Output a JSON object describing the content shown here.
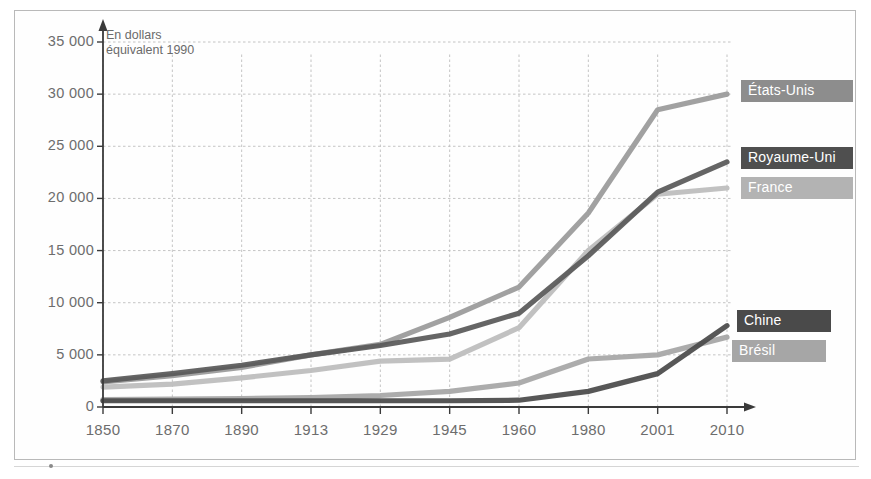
{
  "chart_data": {
    "type": "line",
    "title": "",
    "subtitle": "",
    "unit_note": "En dollars\néquivalent 1990",
    "xlabel": "",
    "ylabel": "",
    "categories": [
      "1850",
      "1870",
      "1890",
      "1913",
      "1929",
      "1945",
      "1960",
      "1980",
      "2001",
      "2010"
    ],
    "ylim": [
      0,
      35000
    ],
    "yticks": [
      0,
      5000,
      10000,
      15000,
      20000,
      25000,
      30000,
      35000
    ],
    "ytick_labels": [
      "0",
      "5 000",
      "10 000",
      "15 000",
      "20 000",
      "25 000",
      "30 000",
      "35 000"
    ],
    "grid": true,
    "legend_position": "right-inline",
    "series": [
      {
        "name": "États-Unis",
        "color": "#9a9a9a",
        "values": [
          2400,
          3000,
          3800,
          5000,
          6000,
          8600,
          11500,
          18600,
          28500,
          30000
        ]
      },
      {
        "name": "Royaume-Uni",
        "color": "#595959",
        "values": [
          2500,
          3200,
          4000,
          5000,
          5900,
          7000,
          9000,
          14500,
          20600,
          23500
        ]
      },
      {
        "name": "France",
        "color": "#bcbcbc",
        "values": [
          1900,
          2200,
          2800,
          3500,
          4400,
          4600,
          7600,
          15000,
          20400,
          21000
        ]
      },
      {
        "name": "Chine",
        "color": "#4a4a4a",
        "values": [
          600,
          600,
          600,
          600,
          600,
          600,
          650,
          1500,
          3200,
          7800
        ]
      },
      {
        "name": "Brésil",
        "color": "#a6a6a6",
        "values": [
          700,
          750,
          800,
          900,
          1100,
          1500,
          2300,
          4600,
          5000,
          6700
        ]
      }
    ]
  },
  "legend": {
    "items": [
      {
        "label": "États-Unis",
        "bg": "#8d8d8d"
      },
      {
        "label": "Royaume-Uni",
        "bg": "#4f4f4f"
      },
      {
        "label": "France",
        "bg": "#b3b3b3"
      },
      {
        "label": "Chine",
        "bg": "#4a4a4a"
      },
      {
        "label": "Brésil",
        "bg": "#a6a6a6"
      }
    ]
  },
  "colors": {
    "frame_border": "#b9b9b9",
    "axis": "#3a3a3a",
    "grid": "#bdbdbd",
    "tick_text": "#6d6d6d",
    "note_text": "#6b6b6b"
  }
}
